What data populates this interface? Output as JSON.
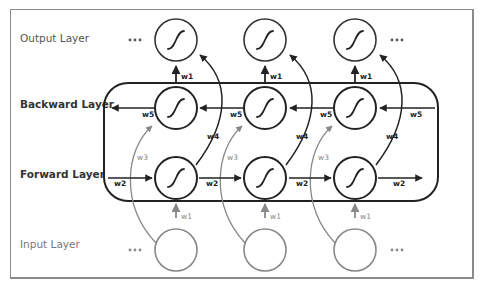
{
  "diagram": {
    "type": "bidirectional-rnn",
    "layers": {
      "output": "Output Layer",
      "backward": "Backward Layer",
      "forward": "Forward Layer",
      "input": "Input Layer"
    },
    "ellipsis": "•••",
    "weights": {
      "w1": "w1",
      "w2": "w2",
      "w3": "w3",
      "w4": "w4",
      "w5": "w5"
    },
    "timesteps": 3,
    "node_icon": "sigmoid-icon",
    "colors": {
      "dark": "#222222",
      "gray": "#888888",
      "frame": "#8a8a8a",
      "text_dark": "#333333",
      "text_gray": "#777777"
    }
  }
}
